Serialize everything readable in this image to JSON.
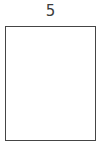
{
  "figure": {
    "type": "labeled-rectangle",
    "background_color": "#ffffff",
    "label": {
      "text": "5",
      "color": "#3c3c3c",
      "position": "top-center"
    },
    "rectangle": {
      "fill_color": "#ffffff",
      "stroke_color": "#454545",
      "stroke_width_px": 1.5,
      "x_px": 5,
      "y_px": 26,
      "width_px": 91,
      "height_px": 115,
      "contents": ""
    }
  }
}
